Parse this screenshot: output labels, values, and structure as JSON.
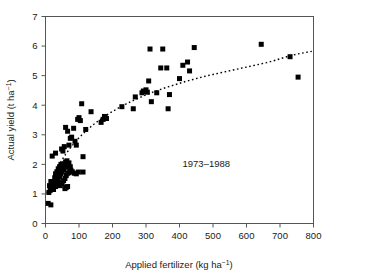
{
  "chart_data": {
    "type": "scatter",
    "title": "",
    "xlabel": "Applied fertilizer (kg ha⁻¹)",
    "ylabel": "Actual yield (t ha⁻¹)",
    "xlabel_base": "Applied fertilizer (kg ha",
    "xlabel_sup": "−1",
    "xlabel_tail": ")",
    "ylabel_base": "Actual yield (t ha",
    "ylabel_sup": "−1",
    "ylabel_tail": ")",
    "xlim": [
      0,
      800
    ],
    "ylim": [
      0,
      7
    ],
    "xticks": [
      0,
      100,
      200,
      300,
      400,
      500,
      600,
      700,
      800
    ],
    "yticks": [
      0,
      1,
      2,
      3,
      4,
      5,
      6,
      7
    ],
    "xtick_labels": [
      "0",
      "100",
      "200",
      "300",
      "400",
      "500",
      "600",
      "700",
      "800"
    ],
    "ytick_labels": [
      "0",
      "1",
      "2",
      "3",
      "4",
      "5",
      "6",
      "7"
    ],
    "grid": false,
    "legend": false,
    "marker": "filled-square",
    "marker_color": "#000000",
    "marker_size": 5,
    "frame": true,
    "tick_direction": "out",
    "annotations": [
      {
        "text": "1973–1988",
        "x": 480,
        "y": 1.92
      }
    ],
    "series": [
      {
        "name": "Observations",
        "points": [
          [
            8,
            0.68
          ],
          [
            16,
            0.63
          ],
          [
            10,
            1.05
          ],
          [
            14,
            1.12
          ],
          [
            18,
            1.18
          ],
          [
            12,
            1.28
          ],
          [
            20,
            1.22
          ],
          [
            22,
            1.35
          ],
          [
            16,
            1.42
          ],
          [
            24,
            1.15
          ],
          [
            26,
            1.32
          ],
          [
            28,
            1.45
          ],
          [
            30,
            1.25
          ],
          [
            32,
            1.55
          ],
          [
            34,
            1.38
          ],
          [
            36,
            1.62
          ],
          [
            38,
            1.48
          ],
          [
            40,
            1.72
          ],
          [
            42,
            1.58
          ],
          [
            44,
            1.8
          ],
          [
            46,
            1.68
          ],
          [
            48,
            1.88
          ],
          [
            50,
            1.75
          ],
          [
            52,
            1.95
          ],
          [
            54,
            1.82
          ],
          [
            56,
            2.02
          ],
          [
            58,
            1.9
          ],
          [
            60,
            2.08
          ],
          [
            62,
            1.98
          ],
          [
            64,
            2.12
          ],
          [
            30,
            1.68
          ],
          [
            34,
            1.75
          ],
          [
            38,
            1.85
          ],
          [
            42,
            1.92
          ],
          [
            46,
            2.0
          ],
          [
            28,
            1.55
          ],
          [
            32,
            1.48
          ],
          [
            36,
            1.3
          ],
          [
            40,
            1.38
          ],
          [
            44,
            1.28
          ],
          [
            50,
            1.35
          ],
          [
            54,
            1.45
          ],
          [
            58,
            1.52
          ],
          [
            62,
            1.62
          ],
          [
            66,
            1.7
          ],
          [
            20,
            2.28
          ],
          [
            30,
            2.38
          ],
          [
            48,
            2.52
          ],
          [
            56,
            2.6
          ],
          [
            52,
            2.45
          ],
          [
            68,
            1.98
          ],
          [
            70,
            2.05
          ],
          [
            72,
            1.88
          ],
          [
            66,
            1.95
          ],
          [
            74,
            1.92
          ],
          [
            62,
            1.22
          ],
          [
            58,
            1.18
          ],
          [
            66,
            1.25
          ],
          [
            70,
            1.72
          ],
          [
            76,
            1.8
          ],
          [
            80,
            1.75
          ],
          [
            86,
            1.7
          ],
          [
            92,
            1.68
          ],
          [
            98,
            1.74
          ],
          [
            112,
            1.74
          ],
          [
            60,
            3.25
          ],
          [
            66,
            3.12
          ],
          [
            74,
            2.88
          ],
          [
            78,
            2.92
          ],
          [
            70,
            2.65
          ],
          [
            84,
            3.22
          ],
          [
            88,
            2.78
          ],
          [
            92,
            2.65
          ],
          [
            96,
            3.52
          ],
          [
            100,
            3.58
          ],
          [
            104,
            3.48
          ],
          [
            108,
            4.05
          ],
          [
            112,
            2.26
          ],
          [
            120,
            3.18
          ],
          [
            136,
            3.78
          ],
          [
            166,
            3.42
          ],
          [
            172,
            3.52
          ],
          [
            178,
            3.58
          ],
          [
            182,
            3.55
          ],
          [
            176,
            3.62
          ],
          [
            228,
            3.95
          ],
          [
            262,
            3.88
          ],
          [
            268,
            4.28
          ],
          [
            288,
            4.42
          ],
          [
            292,
            4.48
          ],
          [
            296,
            4.46
          ],
          [
            300,
            4.52
          ],
          [
            304,
            4.44
          ],
          [
            308,
            4.82
          ],
          [
            312,
            5.9
          ],
          [
            316,
            4.12
          ],
          [
            332,
            4.42
          ],
          [
            344,
            5.26
          ],
          [
            350,
            5.9
          ],
          [
            362,
            5.26
          ],
          [
            366,
            3.88
          ],
          [
            370,
            4.36
          ],
          [
            400,
            4.9
          ],
          [
            410,
            5.35
          ],
          [
            424,
            5.46
          ],
          [
            430,
            5.16
          ],
          [
            444,
            5.95
          ],
          [
            644,
            6.06
          ],
          [
            730,
            5.64
          ],
          [
            754,
            4.95
          ]
        ]
      }
    ],
    "trend": {
      "name": "Fitted response curve",
      "style": "dotted",
      "color": "#000000",
      "points": [
        [
          5,
          1.02
        ],
        [
          20,
          1.52
        ],
        [
          40,
          1.98
        ],
        [
          60,
          2.34
        ],
        [
          80,
          2.64
        ],
        [
          100,
          2.9
        ],
        [
          120,
          3.12
        ],
        [
          140,
          3.32
        ],
        [
          160,
          3.49
        ],
        [
          180,
          3.65
        ],
        [
          200,
          3.79
        ],
        [
          220,
          3.92
        ],
        [
          240,
          4.04
        ],
        [
          260,
          4.15
        ],
        [
          280,
          4.25
        ],
        [
          300,
          4.35
        ],
        [
          320,
          4.44
        ],
        [
          340,
          4.52
        ],
        [
          360,
          4.6
        ],
        [
          380,
          4.67
        ],
        [
          400,
          4.74
        ],
        [
          420,
          4.81
        ],
        [
          440,
          4.87
        ],
        [
          460,
          4.93
        ],
        [
          480,
          4.99
        ],
        [
          500,
          5.04
        ],
        [
          520,
          5.09
        ],
        [
          540,
          5.14
        ],
        [
          560,
          5.19
        ],
        [
          580,
          5.24
        ],
        [
          600,
          5.29
        ],
        [
          620,
          5.34
        ],
        [
          640,
          5.39
        ],
        [
          660,
          5.44
        ],
        [
          680,
          5.5
        ],
        [
          700,
          5.57
        ],
        [
          720,
          5.64
        ],
        [
          740,
          5.7
        ],
        [
          760,
          5.75
        ],
        [
          780,
          5.79
        ],
        [
          795,
          5.82
        ]
      ]
    }
  }
}
